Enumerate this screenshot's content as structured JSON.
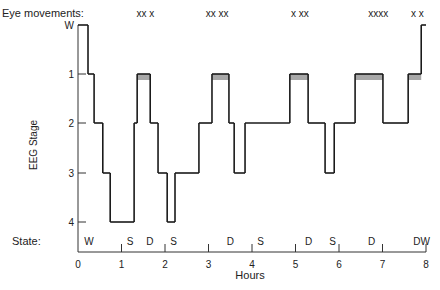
{
  "chart_data": {
    "type": "line",
    "subtype": "hypnogram-step",
    "title": "",
    "xlabel": "Hours",
    "ylabel": "EEG Stage",
    "xlim": [
      0,
      8
    ],
    "x_ticks": [
      "0",
      "1",
      "2",
      "3",
      "4",
      "5",
      "6",
      "7",
      "8"
    ],
    "y_levels": [
      "W",
      "1",
      "2",
      "3",
      "4"
    ],
    "y_tick_labels": [
      "W",
      "1",
      "2",
      "3",
      "4"
    ],
    "eye_movements_label": "Eye movements:",
    "eye_movements": [
      {
        "x": 1.55,
        "text": "xx x"
      },
      {
        "x": 3.2,
        "text": "xx xx"
      },
      {
        "x": 5.1,
        "text": "x xx"
      },
      {
        "x": 6.9,
        "text": "xxxx"
      },
      {
        "x": 7.8,
        "text": "x x"
      }
    ],
    "state_label": "State:",
    "states": [
      {
        "x": 0.25,
        "text": "W"
      },
      {
        "x": 1.2,
        "text": "S"
      },
      {
        "x": 1.65,
        "text": "D"
      },
      {
        "x": 2.2,
        "text": "S"
      },
      {
        "x": 3.5,
        "text": "D"
      },
      {
        "x": 4.2,
        "text": "S"
      },
      {
        "x": 5.3,
        "text": "D"
      },
      {
        "x": 5.85,
        "text": "S"
      },
      {
        "x": 6.75,
        "text": "D"
      },
      {
        "x": 7.9,
        "text": "DW"
      }
    ],
    "state_dividers": [
      1,
      2,
      3,
      4,
      5,
      6,
      7,
      8
    ],
    "segments": [
      {
        "start": 0.0,
        "end": 0.23,
        "stage": "W"
      },
      {
        "start": 0.23,
        "end": 0.37,
        "stage": "1"
      },
      {
        "start": 0.37,
        "end": 0.57,
        "stage": "2"
      },
      {
        "start": 0.57,
        "end": 0.74,
        "stage": "3"
      },
      {
        "start": 0.74,
        "end": 1.29,
        "stage": "4"
      },
      {
        "start": 1.29,
        "end": 1.36,
        "stage": "2"
      },
      {
        "start": 1.36,
        "end": 1.66,
        "stage": "1",
        "rem": true
      },
      {
        "start": 1.66,
        "end": 1.84,
        "stage": "2"
      },
      {
        "start": 1.84,
        "end": 2.05,
        "stage": "3"
      },
      {
        "start": 2.05,
        "end": 2.23,
        "stage": "4"
      },
      {
        "start": 2.23,
        "end": 2.78,
        "stage": "3"
      },
      {
        "start": 2.78,
        "end": 3.08,
        "stage": "2"
      },
      {
        "start": 3.08,
        "end": 3.47,
        "stage": "1",
        "rem": true
      },
      {
        "start": 3.47,
        "end": 3.59,
        "stage": "2"
      },
      {
        "start": 3.59,
        "end": 3.84,
        "stage": "3"
      },
      {
        "start": 3.84,
        "end": 4.87,
        "stage": "2"
      },
      {
        "start": 4.87,
        "end": 5.29,
        "stage": "1",
        "rem": true
      },
      {
        "start": 5.29,
        "end": 5.68,
        "stage": "2"
      },
      {
        "start": 5.68,
        "end": 5.89,
        "stage": "3"
      },
      {
        "start": 5.89,
        "end": 6.37,
        "stage": "2"
      },
      {
        "start": 6.37,
        "end": 7.01,
        "stage": "1",
        "rem": true
      },
      {
        "start": 7.01,
        "end": 7.59,
        "stage": "2"
      },
      {
        "start": 7.59,
        "end": 7.89,
        "stage": "1",
        "rem": true
      },
      {
        "start": 7.89,
        "end": 8.0,
        "stage": "W"
      }
    ],
    "grid": false,
    "colors": {
      "line": "#1a1a1a",
      "rem_fill": "#a8a8a8",
      "axis": "#333333"
    }
  }
}
